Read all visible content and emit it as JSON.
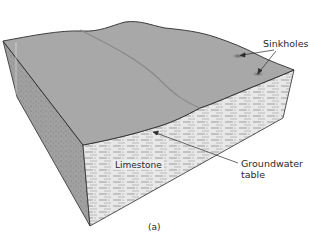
{
  "figure": {
    "caption": "(a)",
    "labels": {
      "sinkholes": "Sinkholes",
      "limestone": "Limestone",
      "groundwater_line1": "Groundwater",
      "groundwater_line2": "table"
    }
  },
  "colors": {
    "surface": "#a8a8a8",
    "front_face": "#e6e6e6",
    "left_face": "#9c9c9c",
    "outline": "#2b2b2b"
  }
}
